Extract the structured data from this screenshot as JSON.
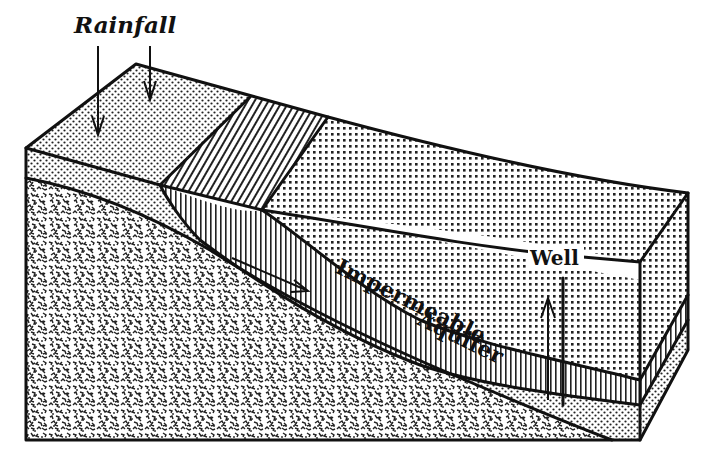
{
  "diagram": {
    "labels": {
      "rainfall": "Rainfall",
      "impermeable": "Impermeable",
      "aquifer": "Aquifer",
      "well": "Well"
    },
    "layers": [
      {
        "name": "surface-soil",
        "pattern": "fine-dots"
      },
      {
        "name": "recharge-outcrop",
        "pattern": "diagonal-hatch"
      },
      {
        "name": "impermeable",
        "pattern": "vertical-lines"
      },
      {
        "name": "aquifer",
        "pattern": "fine-dots"
      },
      {
        "name": "bedrock",
        "pattern": "random-speckle"
      },
      {
        "name": "overburden",
        "pattern": "grid-dots"
      }
    ],
    "arrows": [
      {
        "name": "rainfall-arrow-left",
        "direction": "down"
      },
      {
        "name": "rainfall-arrow-right",
        "direction": "down"
      },
      {
        "name": "flow-arrow",
        "direction": "down-slope"
      },
      {
        "name": "well-pressure-arrow",
        "direction": "up"
      }
    ],
    "colors": {
      "ink": "#111111",
      "paper": "#ffffff"
    }
  }
}
